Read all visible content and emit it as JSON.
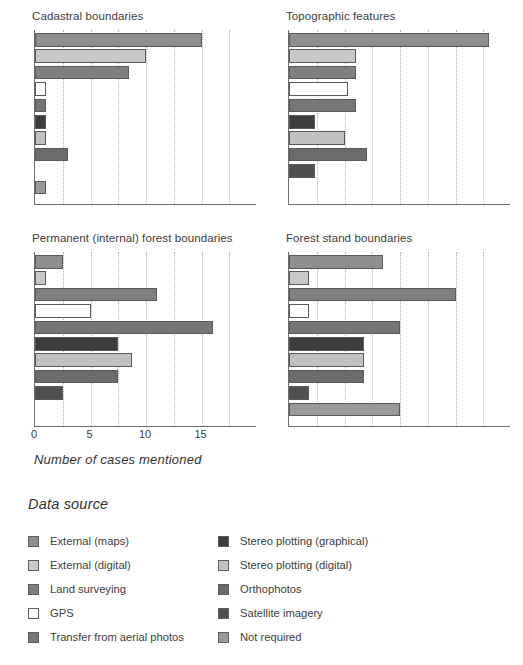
{
  "axis_label": "Number of cases mentioned",
  "legend": {
    "title": "Data source",
    "columns": [
      {
        "items": [
          {
            "label": "External (maps)",
            "color": "#8f8f8f"
          },
          {
            "label": "External (digital)",
            "color": "#c9c9c9"
          },
          {
            "label": "Land surveying",
            "color": "#808080"
          },
          {
            "label": "GPS",
            "color": "#ffffff"
          },
          {
            "label": "Transfer from aerial photos",
            "color": "#767676"
          }
        ]
      },
      {
        "items": [
          {
            "label": "Stereo plotting (graphical)",
            "color": "#3d3d3d"
          },
          {
            "label": "Stereo plotting (digital)",
            "color": "#c1c1c1"
          },
          {
            "label": "Orthophotos",
            "color": "#6b6b6b"
          },
          {
            "label": "Satellite imagery",
            "color": "#4f4f4f"
          },
          {
            "label": "Not required",
            "color": "#9a9a9a"
          }
        ]
      }
    ]
  },
  "chart_data": {
    "type": "bar",
    "orientation": "horizontal",
    "xlabel": "Number of cases mentioned",
    "ylabel": "",
    "xlim": [
      0,
      20
    ],
    "xticks": [
      0,
      5,
      10,
      15
    ],
    "gridlines": [
      0,
      2.5,
      5,
      7.5,
      10,
      12.5,
      15,
      17.5,
      20
    ],
    "grid": true,
    "legend_position": "bottom",
    "categories": [
      "External (maps)",
      "External (digital)",
      "Land surveying",
      "GPS",
      "Transfer from aerial photos",
      "Stereo plotting (graphical)",
      "Stereo plotting (digital)",
      "Orthophotos",
      "Satellite imagery",
      "Not required"
    ],
    "category_colors": [
      "#8f8f8f",
      "#c9c9c9",
      "#808080",
      "#ffffff",
      "#767676",
      "#3d3d3d",
      "#c1c1c1",
      "#6b6b6b",
      "#4f4f4f",
      "#9a9a9a"
    ],
    "panels": [
      {
        "key": "tl",
        "title": "Cadastral boundaries",
        "show_xticks": false,
        "values": [
          15,
          10,
          8.5,
          1,
          1,
          1,
          1,
          3,
          0,
          1
        ]
      },
      {
        "key": "tr",
        "title": "Topographic features",
        "show_xticks": false,
        "values": [
          18,
          6,
          6,
          5.3,
          6,
          2.3,
          5,
          7,
          2.3,
          0
        ]
      },
      {
        "key": "bl",
        "title": "Permanent (internal) forest boundaries",
        "show_xticks": true,
        "values": [
          2.5,
          1,
          11,
          5,
          16,
          7.5,
          8.7,
          7.5,
          2.5,
          0
        ]
      },
      {
        "key": "br",
        "title": "Forest stand boundaries",
        "show_xticks": false,
        "values": [
          8.5,
          1.8,
          15,
          1.8,
          10,
          6.8,
          6.8,
          6.8,
          1.8,
          10
        ]
      }
    ]
  }
}
